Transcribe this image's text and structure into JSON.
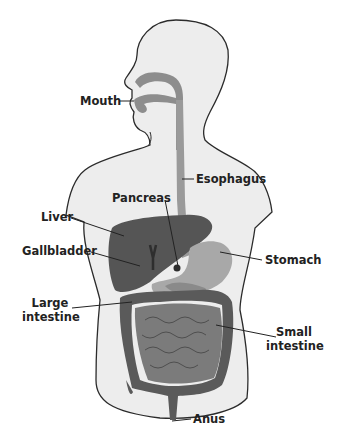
{
  "diagram": {
    "colors": {
      "body_fill": "#ededed",
      "body_outline": "#2b2b2b",
      "esophagus": "#9a9a9a",
      "mouth_tract": "#8d8d8d",
      "liver": "#555555",
      "gallbladder_duct": "#2e2e2e",
      "stomach": "#a8a8a8",
      "pancreas": "#8a8a8a",
      "large_intestine": "#5a5a5a",
      "small_intestine": "#7b7b7b",
      "label_text": "#222222",
      "leader_line": "#222222"
    },
    "labels": {
      "mouth": "Mouth",
      "esophagus": "Esophagus",
      "pancreas": "Pancreas",
      "liver": "Liver",
      "gallbladder": "Gallbladder",
      "stomach": "Stomach",
      "large_intestine_1": "Large",
      "large_intestine_2": "intestine",
      "small_intestine_1": "Small",
      "small_intestine_2": "intestine",
      "anus": "Anus"
    }
  }
}
